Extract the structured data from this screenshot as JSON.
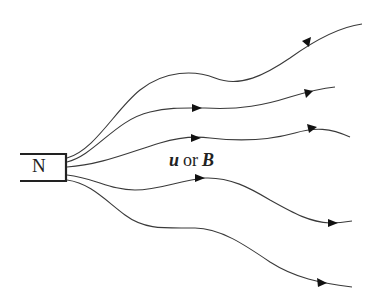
{
  "diagram": {
    "type": "field-lines-from-magnet",
    "magnet": {
      "pole_label": "N"
    },
    "label": {
      "var1": "u",
      "conjunction": "or",
      "var2": "B"
    },
    "line_count": 5,
    "colors": {
      "line": "#3a3a3a",
      "magnet": "#222222",
      "arrow": "#111111",
      "background": "#ffffff"
    }
  }
}
